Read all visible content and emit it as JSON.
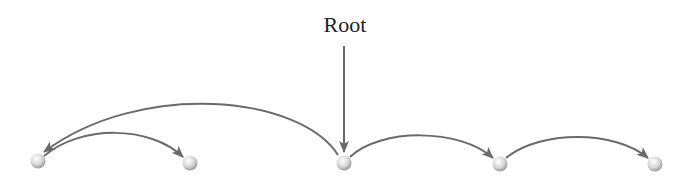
{
  "diagram": {
    "root_label": "Root",
    "colors": {
      "edge": "#6a6a6a",
      "node_light": "#ffffff",
      "node_dark": "#a8a8a8"
    },
    "nodes": [
      {
        "id": "n1",
        "x": 38,
        "y": 161
      },
      {
        "id": "n2",
        "x": 190,
        "y": 163
      },
      {
        "id": "n3",
        "x": 344,
        "y": 163,
        "is_root": true
      },
      {
        "id": "n4",
        "x": 500,
        "y": 164
      },
      {
        "id": "n5",
        "x": 655,
        "y": 164
      }
    ],
    "edges": [
      {
        "from": "n3",
        "to": "n1",
        "label": "long arc"
      },
      {
        "from": "n1",
        "to": "n2"
      },
      {
        "from": "n3",
        "to": "n4"
      },
      {
        "from": "n4",
        "to": "n5"
      },
      {
        "from": "root-label",
        "to": "n3"
      }
    ]
  }
}
